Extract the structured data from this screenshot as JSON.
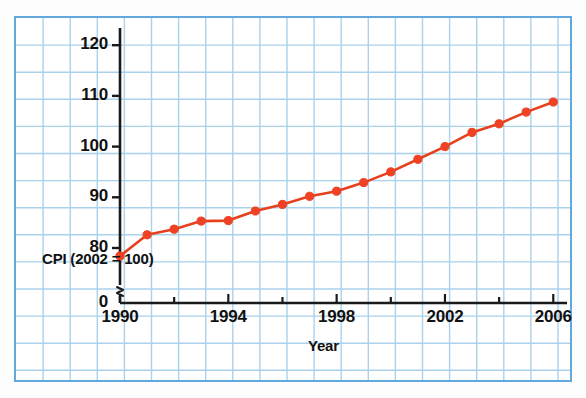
{
  "chart_data": {
    "type": "line",
    "title": "",
    "xlabel": "Year",
    "ylabel": "CPI (2002 = 100)",
    "x": [
      1990,
      1991,
      1992,
      1993,
      1994,
      1995,
      1996,
      1997,
      1998,
      1999,
      2000,
      2001,
      2002,
      2003,
      2004,
      2005,
      2006
    ],
    "values": [
      78.4,
      82.6,
      83.7,
      85.3,
      85.4,
      87.3,
      88.6,
      90.2,
      91.2,
      92.9,
      95.0,
      97.5,
      100.0,
      102.8,
      104.5,
      106.8,
      108.8
    ],
    "series": [
      {
        "name": "CPI (2002 = 100)",
        "values": [
          78.4,
          82.6,
          83.7,
          85.3,
          85.4,
          87.3,
          88.6,
          90.2,
          91.2,
          92.9,
          95.0,
          97.5,
          100.0,
          102.8,
          104.5,
          106.8,
          108.8
        ]
      }
    ],
    "xlim": [
      1990,
      2006
    ],
    "ylim": [
      76.5,
      124
    ],
    "ytick_labels": [
      "0",
      "80",
      "90",
      "100",
      "110",
      "120"
    ],
    "ytick_values": [
      0,
      80,
      90,
      100,
      110,
      120
    ],
    "xtick_labels": [
      "1990",
      "1994",
      "1998",
      "2002",
      "2006"
    ],
    "xtick_values": [
      1990,
      1994,
      1998,
      2002,
      2006
    ],
    "xminor_tick_values": [
      1990,
      1992,
      1994,
      1996,
      1998,
      2000,
      2002,
      2004,
      2006
    ],
    "axis_break": true,
    "axis_break_note": "y-axis broken between 0 and 80",
    "grid": true,
    "legend": "none",
    "line_color": "#e8401c",
    "marker_color": "#ef4123",
    "axis_color": "#1a1a1a",
    "grid_color": "#a9d2ec",
    "frame_color": "#62a8dc",
    "background_color": "#ffffff"
  },
  "figure": {
    "y_axis_title": "CPI (2002 = 100)",
    "x_axis_title": "Year"
  }
}
